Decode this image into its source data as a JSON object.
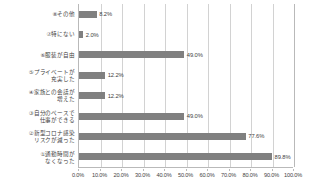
{
  "chart_data": {
    "type": "bar",
    "orientation": "horizontal",
    "title": "",
    "subtitle": "",
    "xlabel": "",
    "ylabel": "",
    "xlim": [
      0,
      100
    ],
    "grid": true,
    "legend": "none",
    "bar_color": "#808080",
    "gridline_color": "#d2d2d2",
    "axis_color": "#b9b9b9",
    "categories": [
      "⑧その他",
      "⑦特にない",
      "⑥服装が自由",
      "⑤プライベートが\n充実した",
      "④家族との会話が\n増えた",
      "③自分のペースで\n仕事ができる",
      "②新型コロナ感染\nリスクが減った",
      "①通勤時間が\nなくなった"
    ],
    "values": [
      8.2,
      2.0,
      49.0,
      12.2,
      12.2,
      49.0,
      77.6,
      89.8
    ],
    "value_labels": [
      "8.2%",
      "2.0%",
      "49.0%",
      "12.2%",
      "12.2%",
      "49.0%",
      "77.6%",
      "89.8%"
    ],
    "xticks": [
      0,
      10,
      20,
      30,
      40,
      50,
      60,
      70,
      80,
      90,
      100
    ],
    "xtick_labels": [
      "0.0%",
      "10.0%",
      "20.0%",
      "30.0%",
      "40.0%",
      "50.0%",
      "60.0%",
      "70.0%",
      "80.0%",
      "90.0%",
      "100.0%"
    ]
  }
}
